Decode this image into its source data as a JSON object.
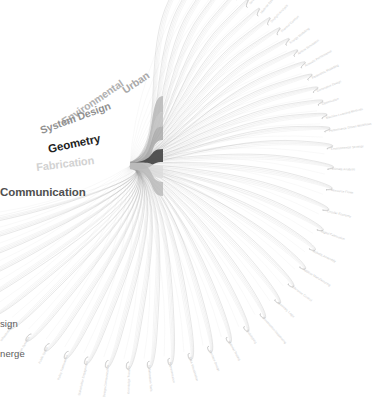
{
  "diagram": {
    "type": "hierarchical-edge-bundling",
    "title": "",
    "background_color": "#ffffff",
    "hub": {
      "x": 132,
      "y": 166
    },
    "sources": [
      {
        "label": "Urban",
        "color": "#a8a8a8",
        "font_size": 10.5,
        "x": 148,
        "y": 74,
        "angle": -34,
        "ribbon_top": 96,
        "ribbon_bottom": 112,
        "ribbon_color": "#b4b4b4"
      },
      {
        "label": "Environmental",
        "color": "#b0b0b0",
        "font_size": 10.5,
        "x": 122,
        "y": 82,
        "angle": -34,
        "ribbon_top": 112,
        "ribbon_bottom": 126,
        "ribbon_color": "#bdbdbd"
      },
      {
        "label": "System Design",
        "color": "#8f8f8f",
        "font_size": 10.5,
        "x": 110,
        "y": 105,
        "angle": -20,
        "ribbon_top": 126,
        "ribbon_bottom": 140,
        "ribbon_color": "#a6a6a6"
      },
      {
        "label": "Geometry",
        "color": "#1f1f1f",
        "font_size": 11.5,
        "x": 100,
        "y": 138,
        "angle": -12,
        "ribbon_top": 149,
        "ribbon_bottom": 162,
        "ribbon_color": "#4a4a4a"
      },
      {
        "label": "Fabrication",
        "color": "#d2d2d2",
        "font_size": 11.0,
        "x": 94,
        "y": 160,
        "angle": -7,
        "ribbon_top": 166,
        "ribbon_bottom": 178,
        "ribbon_color": "#dcdcdc"
      },
      {
        "label": "Communication",
        "color": "#4f4f4f",
        "font_size": 11.5,
        "x": 84,
        "y": 192,
        "angle": 0,
        "ribbon_top": 182,
        "ribbon_bottom": 196,
        "ribbon_color": "#b8b8b8"
      }
    ],
    "corner_labels": [
      {
        "label": "sign",
        "x": 0,
        "y": 318
      },
      {
        "label": "nerge",
        "x": 0,
        "y": 348
      }
    ],
    "targets": [
      {
        "label": "Urban Morphology",
        "angle": -74
      },
      {
        "label": "Spatial Analysis",
        "angle": -70
      },
      {
        "label": "Site Planning",
        "angle": -66
      },
      {
        "label": "Building Massing",
        "angle": -62
      },
      {
        "label": "Facade Systems",
        "angle": -58
      },
      {
        "label": "Structural Logic",
        "angle": -54
      },
      {
        "label": "Material Systems",
        "angle": -50
      },
      {
        "label": "Daylight Analysis",
        "angle": -46
      },
      {
        "label": "Thermal Comfort",
        "angle": -42
      },
      {
        "label": "Energy Modelling",
        "angle": -38
      },
      {
        "label": "Airflow Simulation",
        "angle": -34
      },
      {
        "label": "Acoustic Performance",
        "angle": -30
      },
      {
        "label": "Parametric Modelling",
        "angle": -26
      },
      {
        "label": "Generative Design",
        "angle": -22
      },
      {
        "label": "Optimisation",
        "angle": -18
      },
      {
        "label": "Machine Learning Methods",
        "angle": -14
      },
      {
        "label": "Performance Driven Workflows",
        "angle": -10
      },
      {
        "label": "Environmental Strategy",
        "angle": -5
      },
      {
        "label": "Climate Analysis",
        "angle": 1
      },
      {
        "label": "Resource Flows",
        "angle": 7
      },
      {
        "label": "Circular Economy",
        "angle": 13
      },
      {
        "label": "Digital Fabrication",
        "angle": 19
      },
      {
        "label": "Robotic Assembly",
        "angle": 25
      },
      {
        "label": "Additive Manufacturing",
        "angle": 31
      },
      {
        "label": "Tolerance Control",
        "angle": 37
      },
      {
        "label": "Assembly Logic",
        "angle": 43
      },
      {
        "label": "Construction Sequencing",
        "angle": 49
      },
      {
        "label": "Prototyping",
        "angle": 55
      },
      {
        "label": "Material Testing",
        "angle": 61
      },
      {
        "label": "Interface Design",
        "angle": 67
      },
      {
        "label": "Data Visualisation",
        "angle": 73
      },
      {
        "label": "Representation",
        "angle": 79
      },
      {
        "label": "Collaboration Tools",
        "angle": 85
      },
      {
        "label": "Knowledge Transfer",
        "angle": 91
      },
      {
        "label": "Design Communication",
        "angle": 97
      },
      {
        "label": "Stakeholder Engagement",
        "angle": 103
      },
      {
        "label": "Policy Frameworks",
        "angle": 109
      },
      {
        "label": "Public Space",
        "angle": 115
      },
      {
        "label": "Urban Systems",
        "angle": 121
      },
      {
        "label": "Infrastructure",
        "angle": 127
      },
      {
        "label": "Mobility Networks",
        "angle": 133
      },
      {
        "label": "Density Studies",
        "angle": 139
      },
      {
        "label": "Land Use",
        "angle": 145
      },
      {
        "label": "Growth Scenarios",
        "angle": 151
      },
      {
        "label": "Block Typologies",
        "angle": 157
      },
      {
        "label": "Civic Architecture",
        "angle": 163
      }
    ]
  }
}
